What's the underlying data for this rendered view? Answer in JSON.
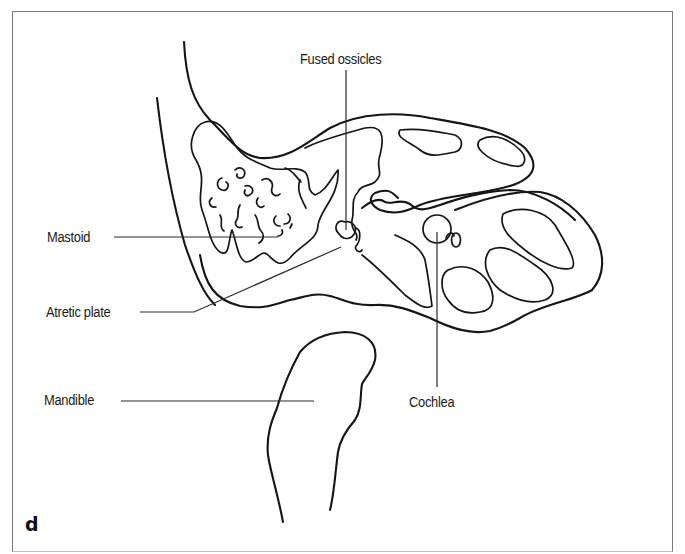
{
  "figure": {
    "panel_letter": "d",
    "labels": {
      "fused_ossicles": "Fused ossicles",
      "mastoid": "Mastoid",
      "atretic_plate": "Atretic plate",
      "mandible": "Mandible",
      "cochlea": "Cochlea"
    },
    "colors": {
      "background": "#ffffff",
      "line": "#151515",
      "frame": "#7a7a7a"
    }
  }
}
